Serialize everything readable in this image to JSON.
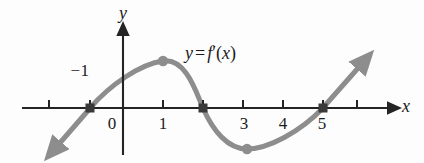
{
  "figure": {
    "kind": "calculus-derivative-graph",
    "background_color": "#fdfdfd",
    "curve_color": "#8d8d8d",
    "axis_color": "#242424",
    "marker_color": "#3a3a3a",
    "dot_color": "#8d8d8d"
  },
  "axes": {
    "x_axis_label": "x",
    "y_axis_label": "y",
    "x_axis_pixel_y": 108,
    "y_axis_pixel_x": 123,
    "unit_pixels": 40,
    "x_ticks": [
      {
        "value": -2,
        "label": "",
        "px": 49
      },
      {
        "value": -1,
        "label": "−1",
        "px": 90
      },
      {
        "value": 0,
        "label": "0",
        "px": 123
      },
      {
        "value": 1,
        "label": "1",
        "px": 163
      },
      {
        "value": 2,
        "label": "",
        "px": 203
      },
      {
        "value": 3,
        "label": "3",
        "px": 243
      },
      {
        "value": 4,
        "label": "4",
        "px": 283
      },
      {
        "value": 5,
        "label": "5",
        "px": 323
      },
      {
        "value": 6,
        "label": "",
        "px": 357
      }
    ],
    "tick_labels_below": [
      "0",
      "1",
      "3",
      "4",
      "5"
    ],
    "tick_label_above": "−1"
  },
  "curve": {
    "label_text": "y = f'(x)",
    "label_parts": {
      "y": "y",
      "equals": "=",
      "f": "f",
      "prime": "′",
      "open": "(",
      "x": "x",
      "close": ")"
    },
    "x_intercepts": [
      -1,
      2,
      5
    ],
    "local_maximum": {
      "x": 1,
      "y_pixel": 61
    },
    "local_minimum": {
      "x": 3.1,
      "y_pixel": 149
    },
    "left_arrow_end": {
      "x_pixel": 55,
      "y_pixel": 148
    },
    "right_arrow_end": {
      "x_pixel": 363,
      "y_pixel": 62
    },
    "path": "M 55 148 L 90 108 C 110 85 140 64 163 61 C 186 58 196 92 203 108 C 213 131 228 149 247 149 C 268 149 300 132 323 108 L 358 69",
    "stroke_width": 5
  },
  "markers": {
    "square_intercepts": [
      {
        "x_pixel": 90,
        "y_pixel": 108
      },
      {
        "x_pixel": 203,
        "y_pixel": 108
      },
      {
        "x_pixel": 323,
        "y_pixel": 108
      }
    ],
    "round_extrema": [
      {
        "x_pixel": 163,
        "y_pixel": 61
      },
      {
        "x_pixel": 247,
        "y_pixel": 149
      }
    ]
  },
  "label_positions": {
    "y_label": {
      "x": 123,
      "y": 4
    },
    "x_label": {
      "x": 406,
      "y": 97
    },
    "neg_one": {
      "x": 80,
      "y": 62
    },
    "curve_label": {
      "x": 185,
      "y": 44
    },
    "tick_text_y": 115
  }
}
